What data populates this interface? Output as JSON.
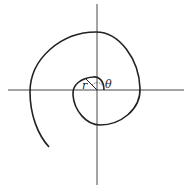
{
  "diagram": {
    "labels": {
      "radius": "r",
      "angle": "θ"
    },
    "colors": {
      "stroke": "#222222",
      "background": "#ffffff"
    }
  }
}
